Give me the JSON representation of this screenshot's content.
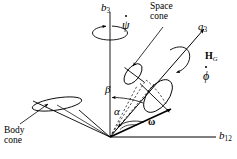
{
  "figure": {
    "background_color": "#ffffff",
    "line_color": "#000000",
    "width": 237,
    "height": 159
  },
  "labels": {
    "b3_axis": {
      "base": "b",
      "subscript": "3"
    },
    "precession_rate": "ψ",
    "space_cone_line1": "Space",
    "space_cone_line2": "cone",
    "a3_axis": {
      "base": "a",
      "subscript": "3"
    },
    "angular_momentum": {
      "base": "H",
      "subscript": "G"
    },
    "spin_rate": "ϕ",
    "nutation_angle": "β",
    "cone_half_angle": "α",
    "angular_velocity": "ω",
    "b12_axis": {
      "base": "b",
      "subscript": "12"
    },
    "body_cone_line1": "Body",
    "body_cone_line2": "cone"
  },
  "geometry": {
    "origin": {
      "x": 110,
      "y": 137
    },
    "b3_axis_top": {
      "x": 110,
      "y": 12
    },
    "b12_axis_right": {
      "x": 216,
      "y": 137
    },
    "a3_axis_tip": {
      "x": 205,
      "y": 28
    },
    "omega_tip": {
      "x": 172,
      "y": 108
    },
    "body_cone_ellipse": {
      "cx": 57,
      "cy": 104,
      "rx": 25,
      "ry": 6,
      "rotation": -8
    },
    "space_cone_base_ellipse": {
      "cx": 160,
      "cy": 93,
      "rx": 11,
      "ry": 20,
      "rotation": 38
    },
    "space_cone_top_ellipse": {
      "cx": 134,
      "cy": 73,
      "rx": 7,
      "ry": 13,
      "rotation": 38
    },
    "precession_arrow_ellipse": {
      "cx": 110,
      "cy": 33,
      "rx": 17,
      "ry": 7
    },
    "spin_arrow_ellipse": {
      "cx": 182,
      "cy": 59,
      "rx": 8,
      "ry": 13,
      "rotation": 38
    }
  }
}
